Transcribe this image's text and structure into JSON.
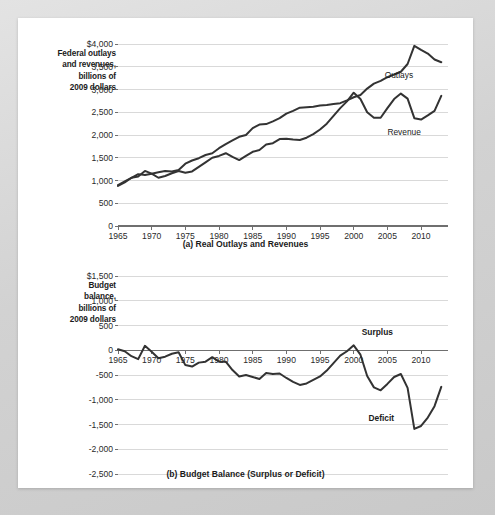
{
  "panel_a": {
    "axis_title_lines": [
      "Federal outlays",
      "and revenues,",
      "billions of",
      "2009 dollars"
    ],
    "caption": "(a) Real Outlays and Revenues",
    "label_outlays": "Outlays",
    "label_revenue": "Revenue"
  },
  "panel_b": {
    "axis_title_lines": [
      "Budget",
      "balance,",
      "billions of",
      "2009 dollars"
    ],
    "caption": "(b) Budget Balance (Surplus or Deficit)",
    "label_surplus": "Surplus",
    "label_deficit": "Deficit"
  },
  "chart_data": [
    {
      "type": "line",
      "title": "(a) Real Outlays and Revenues",
      "xlabel": "",
      "ylabel": "Federal outlays and revenues, billions of 2009 dollars",
      "xlim": [
        1965,
        2014
      ],
      "ylim": [
        0,
        4000
      ],
      "ytick_labels": [
        "$4,000",
        "3,500",
        "3,000",
        "2,500",
        "2,000",
        "1,500",
        "1,000",
        "500",
        "0"
      ],
      "yticks": [
        4000,
        3500,
        3000,
        2500,
        2000,
        1500,
        1000,
        500,
        0
      ],
      "xticks": [
        1965,
        1970,
        1975,
        1980,
        1985,
        1990,
        1995,
        2000,
        2005,
        2010
      ],
      "grid": true,
      "legend_position": "inline-annotation",
      "x": [
        1965,
        1966,
        1967,
        1968,
        1969,
        1970,
        1971,
        1972,
        1973,
        1974,
        1975,
        1976,
        1977,
        1978,
        1979,
        1980,
        1981,
        1982,
        1983,
        1984,
        1985,
        1986,
        1987,
        1988,
        1989,
        1990,
        1991,
        1992,
        1993,
        1994,
        1995,
        1996,
        1997,
        1998,
        1999,
        2000,
        2001,
        2002,
        2003,
        2004,
        2005,
        2006,
        2007,
        2008,
        2009,
        2010,
        2011,
        2012,
        2013
      ],
      "series": [
        {
          "name": "Outlays",
          "values": [
            880,
            960,
            1060,
            1140,
            1120,
            1150,
            1180,
            1210,
            1200,
            1230,
            1370,
            1440,
            1490,
            1560,
            1600,
            1710,
            1800,
            1880,
            1960,
            2000,
            2150,
            2230,
            2240,
            2300,
            2370,
            2470,
            2530,
            2600,
            2610,
            2620,
            2650,
            2660,
            2680,
            2700,
            2760,
            2830,
            2880,
            3020,
            3130,
            3190,
            3270,
            3330,
            3390,
            3560,
            3960,
            3870,
            3790,
            3660,
            3600
          ]
        },
        {
          "name": "Revenue",
          "values": [
            900,
            980,
            1060,
            1090,
            1210,
            1150,
            1060,
            1100,
            1160,
            1210,
            1170,
            1200,
            1300,
            1400,
            1500,
            1540,
            1600,
            1520,
            1450,
            1540,
            1630,
            1670,
            1790,
            1820,
            1910,
            1920,
            1900,
            1890,
            1940,
            2020,
            2120,
            2250,
            2420,
            2590,
            2740,
            2930,
            2790,
            2500,
            2380,
            2380,
            2590,
            2790,
            2910,
            2800,
            2370,
            2340,
            2430,
            2530,
            2860
          ]
        }
      ]
    },
    {
      "type": "line",
      "title": "(b) Budget Balance (Surplus or Deficit)",
      "xlabel": "",
      "ylabel": "Budget balance, billions of 2009 dollars",
      "xlim": [
        1965,
        2014
      ],
      "ylim": [
        -2500,
        1500
      ],
      "ytick_labels": [
        "$1,500",
        "1,000",
        "500",
        "0",
        "-500",
        "-1,000",
        "-1,500",
        "-2,000",
        "-2,500"
      ],
      "yticks": [
        1500,
        1000,
        500,
        0,
        -500,
        -1000,
        -1500,
        -2000,
        -2500
      ],
      "xticks": [
        1965,
        1970,
        1975,
        1980,
        1985,
        1990,
        1995,
        2000,
        2005,
        2010
      ],
      "grid": true,
      "legend_position": "inline-annotation",
      "x": [
        1965,
        1966,
        1967,
        1968,
        1969,
        1970,
        1971,
        1972,
        1973,
        1974,
        1975,
        1976,
        1977,
        1978,
        1979,
        1980,
        1981,
        1982,
        1983,
        1984,
        1985,
        1986,
        1987,
        1988,
        1989,
        1990,
        1991,
        1992,
        1993,
        1994,
        1995,
        1996,
        1997,
        1998,
        1999,
        2000,
        2001,
        2002,
        2003,
        2004,
        2005,
        2006,
        2007,
        2008,
        2009,
        2010,
        2011,
        2012,
        2013
      ],
      "series": [
        {
          "name": "Budget balance",
          "values": [
            20,
            -20,
            -120,
            -180,
            90,
            -30,
            -160,
            -130,
            -70,
            -40,
            -300,
            -330,
            -250,
            -230,
            -140,
            -230,
            -230,
            -400,
            -530,
            -500,
            -540,
            -580,
            -460,
            -480,
            -470,
            -560,
            -640,
            -700,
            -670,
            -600,
            -530,
            -410,
            -260,
            -110,
            -20,
            100,
            -90,
            -520,
            -750,
            -810,
            -680,
            -540,
            -480,
            -760,
            -1590,
            -1530,
            -1360,
            -1130,
            -740
          ]
        }
      ]
    }
  ]
}
